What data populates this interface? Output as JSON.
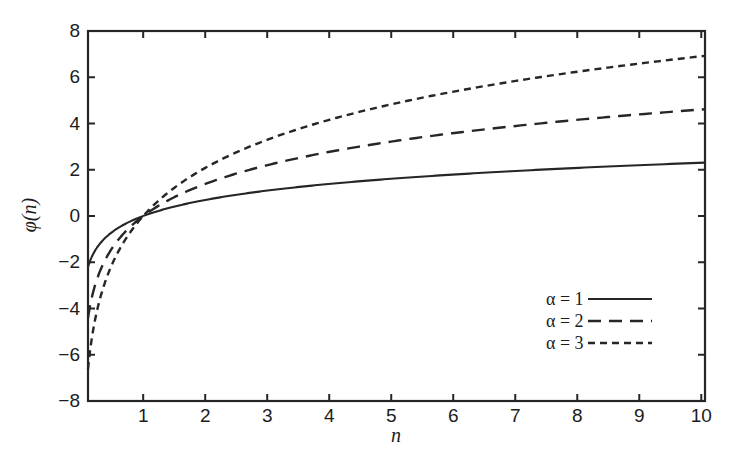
{
  "chart_data": {
    "type": "line",
    "title": "",
    "xlabel": "n",
    "ylabel": "φ(n)",
    "xlim": [
      0.11,
      10.06
    ],
    "ylim": [
      -8,
      8
    ],
    "xticks": [
      1,
      2,
      3,
      4,
      5,
      6,
      7,
      8,
      9,
      10
    ],
    "xtick_labels": [
      "1",
      "2",
      "3",
      "4",
      "5",
      "6",
      "7",
      "8",
      "9",
      "10"
    ],
    "yticks": [
      -8,
      -6,
      -4,
      -2,
      0,
      2,
      4,
      6,
      8
    ],
    "ytick_labels": [
      "−8",
      "−6",
      "−4",
      "−2",
      "0",
      "2",
      "4",
      "6",
      "8"
    ],
    "grid": false,
    "legend_position": "lower right",
    "function": "φ(n) = α ln(n)",
    "line_color": "#262626",
    "x": [
      0.11,
      0.2,
      0.3,
      0.4,
      0.5,
      0.6,
      0.7,
      0.8,
      0.9,
      1.0,
      1.25,
      1.5,
      1.75,
      2.0,
      2.5,
      3.0,
      3.5,
      4.0,
      4.5,
      5.0,
      5.5,
      6.0,
      6.5,
      7.0,
      7.5,
      8.0,
      8.5,
      9.0,
      9.5,
      10.06
    ],
    "series": [
      {
        "name": "α = 1",
        "alpha": 1,
        "dash": "solid",
        "values": [
          -2.207,
          -1.609,
          -1.204,
          -0.916,
          -0.693,
          -0.511,
          -0.357,
          -0.223,
          -0.105,
          0.0,
          0.223,
          0.405,
          0.56,
          0.693,
          0.916,
          1.099,
          1.253,
          1.386,
          1.504,
          1.609,
          1.705,
          1.792,
          1.872,
          1.946,
          2.015,
          2.079,
          2.14,
          2.197,
          2.251,
          2.309
        ]
      },
      {
        "name": "α = 2",
        "alpha": 2,
        "dash": "long-dash",
        "values": [
          -4.415,
          -3.219,
          -2.408,
          -1.833,
          -1.386,
          -1.022,
          -0.713,
          -0.446,
          -0.211,
          0.0,
          0.446,
          0.811,
          1.119,
          1.386,
          1.833,
          2.197,
          2.507,
          2.773,
          3.008,
          3.219,
          3.41,
          3.584,
          3.745,
          3.892,
          4.03,
          4.159,
          4.28,
          4.394,
          4.502,
          4.617
        ]
      },
      {
        "name": "α = 3",
        "alpha": 3,
        "dash": "short-dash",
        "values": [
          -6.622,
          -4.828,
          -3.612,
          -2.749,
          -2.079,
          -1.533,
          -1.07,
          -0.669,
          -0.316,
          0.0,
          0.669,
          1.216,
          1.679,
          2.079,
          2.749,
          3.296,
          3.76,
          4.159,
          4.511,
          4.828,
          5.115,
          5.375,
          5.617,
          5.838,
          6.045,
          6.238,
          6.42,
          6.592,
          6.753,
          6.926
        ]
      }
    ]
  },
  "axes": {
    "x_title": "n",
    "y_title": "φ(n)",
    "x_tick_labels": [
      "1",
      "2",
      "3",
      "4",
      "5",
      "6",
      "7",
      "8",
      "9",
      "10"
    ],
    "y_tick_labels": [
      "8",
      "6",
      "4",
      "2",
      "0",
      "−2",
      "−4",
      "−6",
      "−8"
    ]
  },
  "legend": {
    "entries": [
      {
        "label": "α = 1",
        "style": "solid"
      },
      {
        "label": "α = 2",
        "style": "long-dash"
      },
      {
        "label": "α = 3",
        "style": "short-dash"
      }
    ]
  }
}
